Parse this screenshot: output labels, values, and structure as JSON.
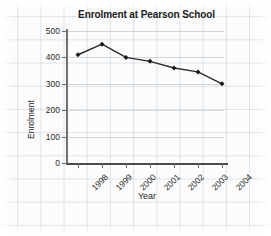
{
  "chart_data": {
    "type": "line",
    "title": "Enrolment at Pearson School",
    "xlabel": "Year",
    "ylabel": "Enrolment",
    "categories": [
      "1998",
      "1999",
      "2000",
      "2001",
      "2002",
      "2003",
      "2004"
    ],
    "values": [
      410,
      450,
      400,
      385,
      360,
      345,
      300
    ],
    "series": [
      {
        "name": "Enrolment",
        "values": [
          410,
          450,
          400,
          385,
          360,
          345,
          300
        ]
      }
    ],
    "ylim": [
      0,
      500
    ],
    "yticks": [
      0,
      100,
      200,
      300,
      400,
      500
    ],
    "ytick_labels": [
      "0",
      "100",
      "200",
      "300",
      "400",
      "500"
    ],
    "grid": "horizontal",
    "legend": "none",
    "marker": "diamond",
    "line_color": "#2b2b2b",
    "marker_color": "#1a1a1a",
    "grid_color": "#8ca0b4",
    "background_color": "#fcfcfc",
    "text_color": "#2a2a2a"
  }
}
